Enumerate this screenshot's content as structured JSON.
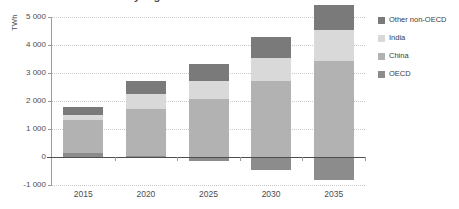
{
  "ylabel_text": "TWh",
  "title_partial": "e by region in the New Policies Scenario",
  "chart_data": {
    "type": "bar",
    "stacked": true,
    "title": "",
    "xlabel": "",
    "ylabel": "TWh",
    "categories": [
      "2015",
      "2020",
      "2025",
      "2030",
      "2035"
    ],
    "ylim": [
      -1000,
      5000
    ],
    "ytick_values": [
      5000,
      4000,
      3000,
      2000,
      1000,
      0,
      -1000
    ],
    "ytick_labels": [
      "5 000",
      "4 000",
      "3 000",
      "2 000",
      "1 000",
      "0",
      "-1 000"
    ],
    "grid": true,
    "legend_position": "right",
    "series": [
      {
        "name": "OECD",
        "color": "#8c8c8c",
        "values": [
          130,
          30,
          -160,
          -480,
          -830
        ]
      },
      {
        "name": "China",
        "color": "#b2b2b2",
        "values": [
          1200,
          1700,
          2080,
          2720,
          3420
        ]
      },
      {
        "name": "India",
        "color": "#d9d9d9",
        "values": [
          180,
          530,
          620,
          820,
          1120
        ]
      },
      {
        "name": "Other non-OECD",
        "color": "#7a7a7a",
        "values": [
          290,
          470,
          620,
          730,
          880
        ]
      }
    ],
    "legend_order": [
      "Other non-OECD",
      "India",
      "China",
      "OECD"
    ],
    "totals_positive": [
      1800,
      2700,
      3320,
      4270,
      5420
    ]
  },
  "colors": {
    "other_non_oecd": "#7a7a7a",
    "india": "#d9d9d9",
    "china": "#b2b2b2",
    "oecd": "#8c8c8c",
    "axis": "#9a9a9a",
    "zero_line": "#4f4f4f",
    "grid": "#c9c9c9",
    "text": "#4d4d4d",
    "background": "#ffffff"
  }
}
